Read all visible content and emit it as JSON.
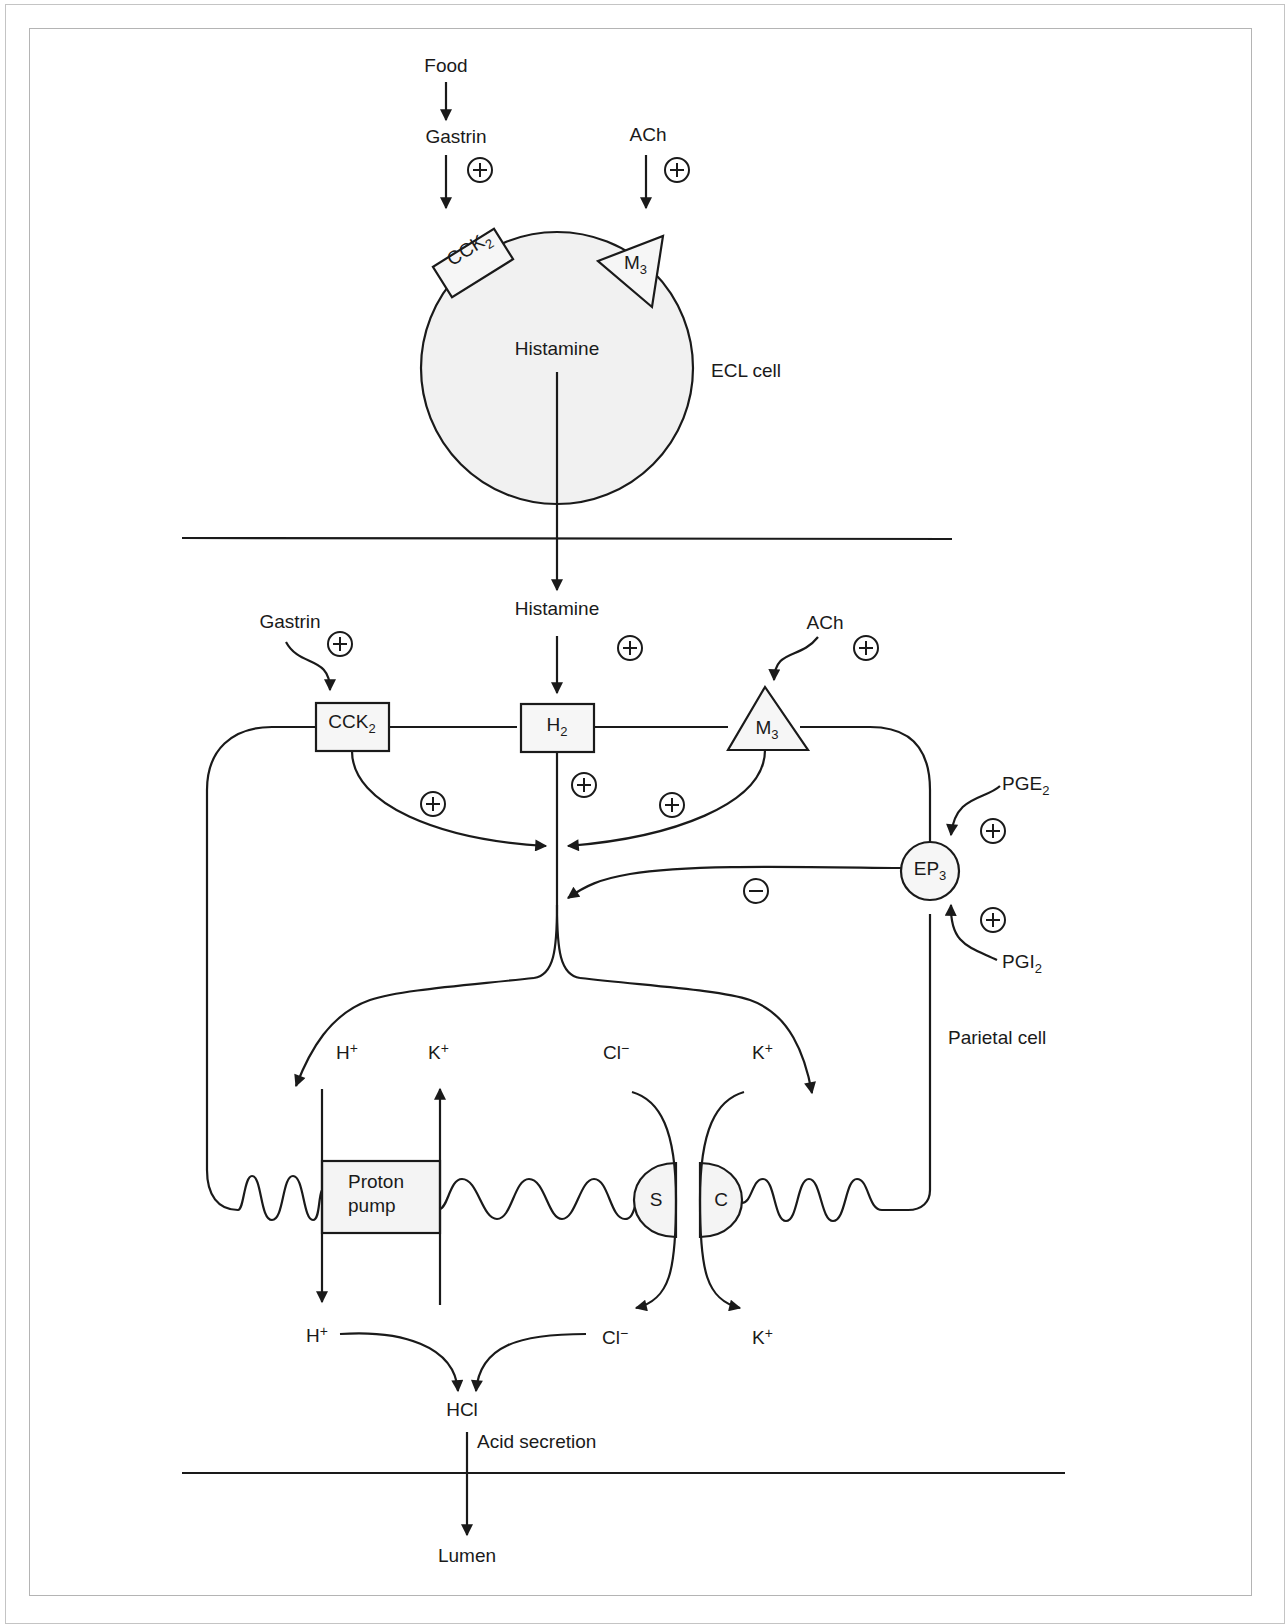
{
  "figure": {
    "ecl": {
      "food": "Food",
      "gastrin": "Gastrin",
      "ach": "ACh",
      "receptor_cck2": "CCK",
      "receptor_cck2_sub": "2",
      "receptor_m3": "M",
      "receptor_m3_sub": "3",
      "histamine": "Histamine",
      "cell_label": "ECL cell",
      "signs": [
        "+",
        "+"
      ]
    },
    "parietal": {
      "histamine_in": "Histamine",
      "gastrin_in": "Gastrin",
      "ach_in": "ACh",
      "receptors": {
        "cck2": {
          "main": "CCK",
          "sub": "2"
        },
        "h2": {
          "main": "H",
          "sub": "2"
        },
        "m3": {
          "main": "M",
          "sub": "3"
        },
        "ep3": {
          "main": "EP",
          "sub": "3"
        }
      },
      "pge2": {
        "main": "PGE",
        "sub": "2"
      },
      "pgi2": {
        "main": "PGI",
        "sub": "2"
      },
      "cell_label": "Parietal cell",
      "ions_top": {
        "h": {
          "main": "H",
          "sup": "+"
        },
        "k1": {
          "main": "K",
          "sup": "+"
        },
        "cl": {
          "main": "Cl",
          "sup": "−"
        },
        "k2": {
          "main": "K",
          "sup": "+"
        }
      },
      "proton_pump_line1": "Proton",
      "proton_pump_line2": "pump",
      "transporter_s": "S",
      "transporter_c": "C",
      "ions_bottom": {
        "h": {
          "main": "H",
          "sup": "+"
        },
        "cl": {
          "main": "Cl",
          "sup": "−"
        },
        "k": {
          "main": "K",
          "sup": "+"
        }
      },
      "hcl": "HCl",
      "acid_secretion": "Acid secretion",
      "lumen": "Lumen",
      "inhibitory_sign": "−"
    },
    "colors": {
      "stroke": "#1a1a1a",
      "cell_fill": "#f1f1f1",
      "frame": "#b4b4b4",
      "background": "#ffffff"
    }
  }
}
